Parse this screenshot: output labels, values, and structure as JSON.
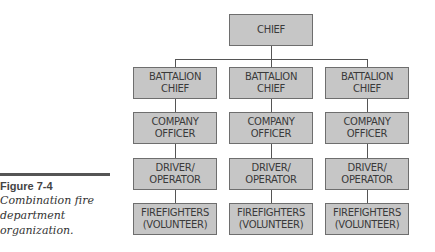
{
  "figure": {
    "label": "Figure 7-4",
    "caption_lines": [
      "Combination fire",
      "department",
      "organization."
    ]
  },
  "chart": {
    "root": {
      "line1": "CHIEF"
    },
    "columns": [
      {
        "boxes": [
          {
            "line1": "BATTALION",
            "line2": "CHIEF"
          },
          {
            "line1": "COMPANY",
            "line2": "OFFICER"
          },
          {
            "line1": "DRIVER/",
            "line2": "OPERATOR"
          },
          {
            "line1": "FIREFIGHTERS",
            "line2": "(VOLUNTEER)"
          }
        ]
      },
      {
        "boxes": [
          {
            "line1": "BATTALION",
            "line2": "CHIEF"
          },
          {
            "line1": "COMPANY",
            "line2": "OFFICER"
          },
          {
            "line1": "DRIVER/",
            "line2": "OPERATOR"
          },
          {
            "line1": "FIREFIGHTERS",
            "line2": "(VOLUNTEER)"
          }
        ]
      },
      {
        "boxes": [
          {
            "line1": "BATTALION",
            "line2": "CHIEF"
          },
          {
            "line1": "COMPANY",
            "line2": "OFFICER"
          },
          {
            "line1": "DRIVER/",
            "line2": "OPERATOR"
          },
          {
            "line1": "FIREFIGHTERS",
            "line2": "(VOLUNTEER)"
          }
        ]
      }
    ]
  },
  "colors": {
    "box_fill": "#c6c6c6",
    "box_border": "#6e6e6e",
    "text": "#3a3a3a"
  }
}
